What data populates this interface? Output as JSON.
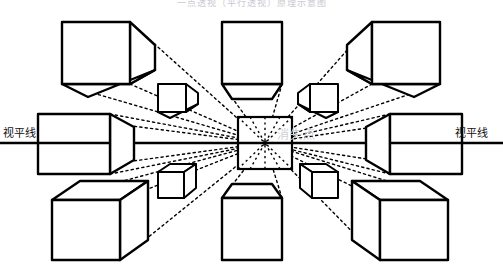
{
  "figure": {
    "kind": "perspective-diagram",
    "title_cropped": "一点透视（平行透视）原理示意图",
    "background": "#ffffff",
    "stroke": "#000000",
    "dotted_stroke": "#000000",
    "watermark_color": "#cfcfd4",
    "title_color": "#c9c9cf"
  },
  "labels": {
    "left_horizon": "视平线",
    "right_horizon": "视平线",
    "vanishing_point": "消失点"
  },
  "geometry": {
    "horizon_y": 143,
    "vanishing_point": {
      "x": 265,
      "y": 143
    },
    "horizon_line": {
      "x1": 0,
      "x2": 503,
      "y": 143
    },
    "center_square": {
      "x": 238,
      "y": 117,
      "w": 54,
      "h": 52
    }
  },
  "cubes": [
    {
      "name": "top-left",
      "face": {
        "x": 62,
        "y": 22,
        "w": 68,
        "h": 62
      },
      "shows": [
        "front",
        "right",
        "bottom"
      ]
    },
    {
      "name": "top-center",
      "face": {
        "x": 222,
        "y": 22,
        "w": 60,
        "h": 62
      },
      "shows": [
        "front",
        "bottom"
      ]
    },
    {
      "name": "top-right",
      "face": {
        "x": 372,
        "y": 22,
        "w": 68,
        "h": 62
      },
      "shows": [
        "front",
        "left",
        "bottom"
      ]
    },
    {
      "name": "middle-left",
      "face": {
        "x": 38,
        "y": 114,
        "w": 72,
        "h": 60
      },
      "shows": [
        "front",
        "right"
      ]
    },
    {
      "name": "middle-right",
      "face": {
        "x": 390,
        "y": 114,
        "w": 72,
        "h": 60
      },
      "shows": [
        "front",
        "left"
      ]
    },
    {
      "name": "bottom-left",
      "face": {
        "x": 52,
        "y": 200,
        "w": 68,
        "h": 60
      },
      "shows": [
        "front",
        "right",
        "top"
      ]
    },
    {
      "name": "bottom-center",
      "face": {
        "x": 222,
        "y": 198,
        "w": 60,
        "h": 62
      },
      "shows": [
        "front",
        "top"
      ]
    },
    {
      "name": "bottom-right",
      "face": {
        "x": 380,
        "y": 200,
        "w": 68,
        "h": 60
      },
      "shows": [
        "front",
        "left",
        "top"
      ]
    },
    {
      "name": "inner-top-left",
      "face": {
        "x": 158,
        "y": 84,
        "w": 28,
        "h": 28
      },
      "shows": [
        "front",
        "right",
        "bottom"
      ]
    },
    {
      "name": "inner-top-right",
      "face": {
        "x": 310,
        "y": 84,
        "w": 28,
        "h": 28
      },
      "shows": [
        "front",
        "left",
        "bottom"
      ]
    },
    {
      "name": "inner-bottom-left",
      "face": {
        "x": 158,
        "y": 172,
        "w": 26,
        "h": 26
      },
      "shows": [
        "front",
        "right",
        "top"
      ]
    },
    {
      "name": "inner-bottom-right",
      "face": {
        "x": 312,
        "y": 172,
        "w": 26,
        "h": 26
      },
      "shows": [
        "front",
        "left",
        "top"
      ]
    }
  ]
}
